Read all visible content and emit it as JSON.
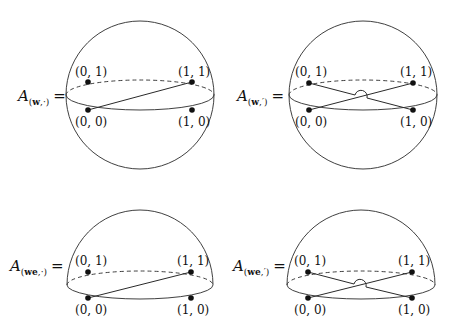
{
  "figures": [
    {
      "id": "sphere-w-dot",
      "shape": "sphere",
      "label": {
        "A": "A",
        "sub_bold": "w",
        "sub_rest": ",·",
        "open": "(",
        "close": ")",
        "eq": "="
      },
      "points": [
        {
          "name": "(0,1)",
          "label": "(0, 1)"
        },
        {
          "name": "(1,1)",
          "label": "(1, 1)"
        },
        {
          "name": "(0,0)",
          "label": "(0, 0)"
        },
        {
          "name": "(1,0)",
          "label": "(1, 0)"
        }
      ],
      "edges": [
        [
          "(0,0)",
          "(1,1)"
        ]
      ]
    },
    {
      "id": "sphere-w-prime",
      "shape": "sphere",
      "label": {
        "A": "A",
        "sub_bold": "w",
        "sub_rest": ",′",
        "open": "(",
        "close": ")",
        "eq": "="
      },
      "points": [
        {
          "name": "(0,1)",
          "label": "(0, 1)"
        },
        {
          "name": "(1,1)",
          "label": "(1, 1)"
        },
        {
          "name": "(0,0)",
          "label": "(0, 0)"
        },
        {
          "name": "(1,0)",
          "label": "(1, 0)"
        }
      ],
      "edges": [
        [
          "(0,0)",
          "(1,1)"
        ],
        [
          "(0,1)",
          "(1,0)"
        ]
      ],
      "crossing": "over-bridge"
    },
    {
      "id": "hemisphere-we-dot",
      "shape": "hemisphere",
      "label": {
        "A": "A",
        "sub_bold": "we",
        "sub_rest": ",·",
        "open": "(",
        "close": ")",
        "eq": "="
      },
      "points": [
        {
          "name": "(0,1)",
          "label": "(0, 1)"
        },
        {
          "name": "(1,1)",
          "label": "(1, 1)"
        },
        {
          "name": "(0,0)",
          "label": "(0, 0)"
        },
        {
          "name": "(1,0)",
          "label": "(1, 0)"
        }
      ],
      "edges": [
        [
          "(0,0)",
          "(1,1)"
        ]
      ]
    },
    {
      "id": "hemisphere-we-prime",
      "shape": "hemisphere",
      "label": {
        "A": "A",
        "sub_bold": "we",
        "sub_rest": ",′",
        "open": "(",
        "close": ")",
        "eq": "="
      },
      "points": [
        {
          "name": "(0,1)",
          "label": "(0, 1)"
        },
        {
          "name": "(1,1)",
          "label": "(1, 1)"
        },
        {
          "name": "(0,0)",
          "label": "(0, 0)"
        },
        {
          "name": "(1,0)",
          "label": "(1, 0)"
        }
      ],
      "edges": [
        [
          "(0,0)",
          "(1,1)"
        ],
        [
          "(0,1)",
          "(1,0)"
        ]
      ],
      "crossing": "over-bridge"
    }
  ],
  "colors": {
    "ink": "#111111",
    "background": "#ffffff"
  }
}
